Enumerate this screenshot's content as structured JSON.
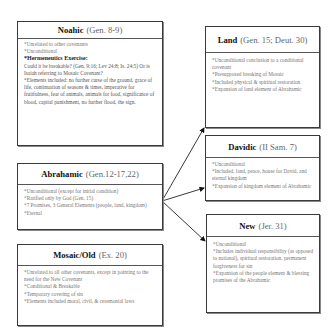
{
  "covenants": {
    "noahic": {
      "name": "Noahic",
      "ref": "(Gen. 8-9)",
      "items": [
        "*Unrelated to other covenants",
        "*Unconditional"
      ],
      "exercise_title": "*Hermeneutics Exercise:",
      "exercise_text": "Could it be breakable? (Gen. 9:16; Lev 24:8; Is. 24:5) Or is Isaiah referring to Mosaic Covenant?",
      "elements": "*Elements included: no further curse of the ground, grace of life, continuation of seasons & times, imperative for fruitfulness, fear of animals, animals for food, significance of blood, capital punishment, no further flood, the sign."
    },
    "abrahamic": {
      "name": "Abrahamic",
      "ref": "(Gen.12-17,22)",
      "items": [
        "*Unconditional (except for initial condition)",
        "*Ratified only by God (Gen. 15)",
        "*7 Promises, 3 General Elements (people, land, kingdom)",
        "*Eternal"
      ]
    },
    "mosaic": {
      "name": "Mosaic/Old",
      "ref": "(Ex. 20)",
      "items": [
        "*Unrelated to all other covenants, except in pointing to the need for the New Covenant",
        "*Conditional & Breakable",
        "*Temporary covering of sin",
        "*Elements included moral, civil, & ceremonial laws"
      ]
    },
    "land": {
      "name": "Land",
      "ref": "(Gen. 15; Deut. 30)",
      "items": [
        "*Unconditional conclusion to a conditional covenant",
        "*Presupposed breaking of Mosaic",
        "*Included physical & spiritual restoration",
        "*Expansion of land element of Abrahamic"
      ]
    },
    "davidic": {
      "name": "Davidic",
      "ref": "(II Sam. 7)",
      "items": [
        "*Unconditional",
        "*Included, land, peace, house for David, and eternal kingdom",
        "*Expansion of kingdom element of Abrahamic"
      ]
    },
    "new": {
      "name": "New",
      "ref": "(Jer. 31)",
      "items": [
        "*Unconditional",
        "*Includes individual responsibility (as opposed to national), spiritual restoration, permanent forgiveness for sin",
        "*Expansion of the people element & blessing promises of the Abrahamic"
      ]
    }
  },
  "arrows": [
    {
      "from": "abrahamic",
      "to": "land"
    },
    {
      "from": "abrahamic",
      "to": "davidic"
    },
    {
      "from": "abrahamic",
      "to": "new"
    }
  ],
  "colors": {
    "border": "#3a3a3a",
    "heading": "#111111",
    "text": "#777777"
  }
}
